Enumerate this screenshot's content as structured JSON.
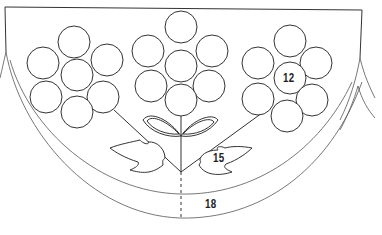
{
  "diagram": {
    "type": "embroidery-pattern",
    "colors": {
      "line": "#333333",
      "background": "#ffffff"
    },
    "labels": [
      {
        "id": "center-flower-label",
        "text": "12",
        "x": 283,
        "y": 70
      },
      {
        "id": "leaf-label",
        "text": "15",
        "x": 213,
        "y": 158
      },
      {
        "id": "border-band-label",
        "text": "18",
        "x": 205,
        "y": 200
      }
    ],
    "flowers": [
      {
        "name": "left-flower",
        "circles": [
          [
            74,
            42
          ],
          [
            43,
            63
          ],
          [
            107,
            60
          ],
          [
            77,
            75
          ],
          [
            46,
            97
          ],
          [
            103,
            97
          ],
          [
            77,
            112
          ]
        ]
      },
      {
        "name": "middle-flower",
        "circles": [
          [
            181,
            27
          ],
          [
            148,
            51
          ],
          [
            212,
            51
          ],
          [
            181,
            66
          ],
          [
            151,
            86
          ],
          [
            209,
            86
          ],
          [
            181,
            100
          ]
        ]
      },
      {
        "name": "right-flower",
        "circles": [
          [
            290,
            41
          ],
          [
            258,
            63
          ],
          [
            316,
            63
          ],
          [
            290,
            78
          ],
          [
            258,
            99
          ],
          [
            312,
            100
          ],
          [
            287,
            116
          ]
        ]
      }
    ],
    "petal_radius": 16
  }
}
